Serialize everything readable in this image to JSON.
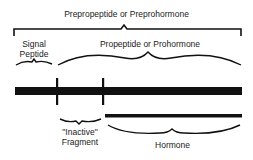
{
  "diagram": {
    "type": "peptide-hormone-processing",
    "labels": {
      "preprohormone": "Prepropeptide or Preprohormone",
      "signal_peptide_line1": "Signal",
      "signal_peptide_line2": "Peptide",
      "prohormone": "Propeptide or Prohormone",
      "inactive_line1": "\"Inactive\"",
      "inactive_line2": "Fragment",
      "hormone": "Hormone"
    },
    "colors": {
      "ink": "#111111",
      "background": "#ffffff"
    }
  }
}
